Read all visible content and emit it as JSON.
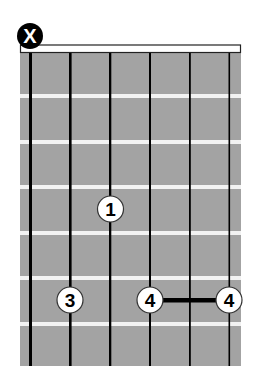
{
  "chord_diagram": {
    "strings": 6,
    "frets_shown": 7,
    "colors": {
      "fretboard": "#a3a3a3",
      "fret_line": "#f2f2f2",
      "string": "#000000",
      "nut_fill": "#ffffff",
      "finger_fill": "#ffffff",
      "muted_fill": "#000000"
    },
    "muted_marker": {
      "string": 1,
      "label": "X"
    },
    "fingers": [
      {
        "label": "1",
        "string": 3,
        "fret": 4
      },
      {
        "label": "3",
        "string": 2,
        "fret": 6
      },
      {
        "label": "4",
        "string": 4,
        "fret": 6
      },
      {
        "label": "4",
        "string": 6,
        "fret": 6
      }
    ],
    "barre": {
      "from_string": 4,
      "to_string": 6,
      "fret": 6
    }
  }
}
